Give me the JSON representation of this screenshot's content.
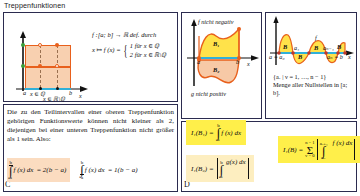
{
  "page": {
    "title": "Treppenfunktionen"
  },
  "panels": {
    "a": {
      "label": "",
      "definition_line": "f :[a; b] → ℝ def. durch",
      "mapping": "x ↦ f (x) =",
      "case1": "1  für  x ∈ ℚ",
      "case2": "2  für  x ∈ ℝ\\ℚ",
      "axis_x_label": "x",
      "tick_a": "a",
      "tick_b": "b",
      "tick_q": "x ∈ ℚ",
      "tick_rq": "x ∈ ℝ\\ℚ"
    },
    "c": {
      "label": "C",
      "body": "Die zu den Teilintervallen einer oberen Treppenfunktion gehörigen Funktionswerte können nicht kleiner als 2, diejenigen bei einer unteren Treppenfunktion nicht größer als 1 sein. Also:",
      "upper_integral": {
        "lower_limit": "a",
        "upper_limit": "b",
        "integrand": "f (x) dx",
        "equals": "= 2(b − a)"
      },
      "lower_integral": {
        "lower_limit": "a",
        "upper_limit": "b",
        "integrand": "f (x) dx",
        "equals": "= 1(b − a)"
      }
    },
    "b": {
      "caption_top": "f nicht negativ",
      "caption_bottom": "g nicht positiv",
      "region_top": "B₁",
      "region_bottom": "B₂",
      "axis_x_label": "x",
      "tick_a": "a",
      "tick_b": "b"
    },
    "bd": {
      "fn_label": "f",
      "axis_x_label": "x",
      "region1": "B",
      "region2": "B",
      "region3": "B",
      "region4": "B",
      "tick_a0": "a = a₀",
      "tick_a1": "a₁",
      "tick_an1": "aₙ₋₁",
      "tick_an": "aₙ = b",
      "note_set": "{aᵥ | ν = 1, …, n − 1}",
      "note_text": "Menge aller Nullstellen in [a; b]."
    },
    "d": {
      "label": "D",
      "formula1": {
        "lhs": "I₁(B₁) =",
        "lower": "a",
        "upper": "b",
        "integrand": "f (x) dx"
      },
      "formula2": {
        "lhs": "I₁(B₂) =",
        "lower": "a",
        "upper": "b",
        "integrand": "g(x) dx"
      },
      "formula3": {
        "lhs": "I₁(B) =",
        "sum_lower": "ν = 0",
        "sum_upper": "n − 1",
        "int_lower": "aᵥ",
        "int_upper": "aᵥ₊₁",
        "integrand": "f (x) dx"
      }
    }
  },
  "colors": {
    "orange": "#e8601c",
    "orange_fill": "#f8d0b0",
    "blue": "#30b0d8",
    "green": "#3aa03a",
    "yellow": "#ffef4a",
    "border": "#2b2b4f"
  }
}
